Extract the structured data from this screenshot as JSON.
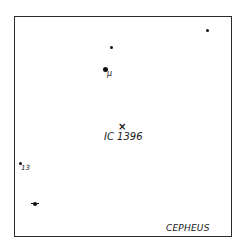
{
  "chart": {
    "constellation": "CEPHEUS",
    "object": {
      "label": "IC 1396",
      "marker": "x-mark",
      "x": 122,
      "y": 128
    },
    "stars": [
      {
        "id": "star-top-right",
        "x": 207,
        "y": 30,
        "size": 2.5,
        "label": ""
      },
      {
        "id": "star-upper",
        "x": 112,
        "y": 47,
        "size": 3,
        "label": ""
      },
      {
        "id": "star-mu",
        "x": 106,
        "y": 69,
        "size": 4.5,
        "label": "μ"
      },
      {
        "id": "star-13",
        "x": 21,
        "y": 163,
        "size": 3,
        "label": "13"
      },
      {
        "id": "star-lower-left",
        "x": 35,
        "y": 203,
        "size": 3,
        "label": ""
      }
    ]
  }
}
